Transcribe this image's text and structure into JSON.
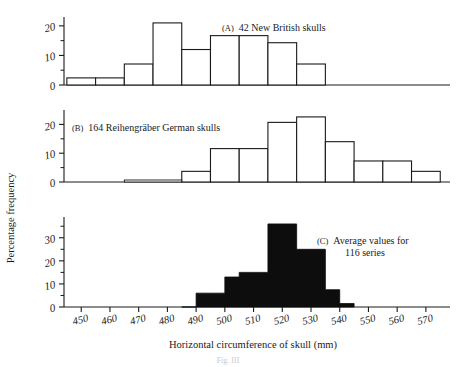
{
  "figure": {
    "axis_x_title": "Horizontal circumference of skull (mm)",
    "axis_y_title": "Percentage frequency",
    "caption": "Fig. III"
  },
  "axes": {
    "x_ticks": [
      "450",
      "460",
      "470",
      "480",
      "490",
      "500",
      "510",
      "520",
      "530",
      "540",
      "550",
      "560",
      "570"
    ],
    "x_tick_values": [
      450,
      460,
      470,
      480,
      490,
      500,
      510,
      520,
      530,
      540,
      550,
      560,
      570
    ],
    "x_min": 444,
    "x_max": 577,
    "panel_a_y_ticks": [
      "0",
      "10",
      "20"
    ],
    "panel_b_y_ticks": [
      "0",
      "10",
      "20"
    ],
    "panel_c_y_ticks": [
      "0",
      "10",
      "20",
      "30"
    ]
  },
  "panels": {
    "a": {
      "tag": "(A)",
      "note": "42 New British skulls",
      "y_max": 23,
      "y_ticks": [
        0,
        10,
        20
      ],
      "y_minor": [
        5,
        15
      ]
    },
    "b": {
      "tag": "(B)",
      "note": "164 Reihengräber German skulls",
      "y_max": 25,
      "y_ticks": [
        0,
        10,
        20
      ],
      "y_minor": [
        5,
        15
      ]
    },
    "c": {
      "tag": "(C)",
      "note_line1": "Average values for",
      "note_line2": "116 series",
      "y_max": 39,
      "y_ticks": [
        0,
        10,
        20,
        30
      ],
      "y_minor": [
        5,
        15,
        25,
        35
      ]
    }
  },
  "chart_data": [
    {
      "type": "bar",
      "id": "panel-a",
      "title": "(A) 42 New British skulls",
      "xlabel": "Horizontal circumference of skull (mm)",
      "ylabel": "Percentage frequency",
      "xlim": [
        444,
        577
      ],
      "ylim": [
        0,
        23
      ],
      "bin_width": 10,
      "grid": false,
      "filled": false,
      "bin_starts": [
        445,
        455,
        465,
        475,
        485,
        495,
        505,
        515,
        525
      ],
      "categories": [
        "445-455",
        "455-465",
        "465-475",
        "475-485",
        "485-495",
        "495-505",
        "505-515",
        "515-525",
        "525-535"
      ],
      "values": [
        2.4,
        2.4,
        7.1,
        21.0,
        12.0,
        16.7,
        16.7,
        14.3,
        7.1
      ]
    },
    {
      "type": "bar",
      "id": "panel-b",
      "title": "(B) 164 Reihengräber German skulls",
      "xlabel": "Horizontal circumference of skull (mm)",
      "ylabel": "Percentage frequency",
      "xlim": [
        444,
        577
      ],
      "ylim": [
        0,
        25
      ],
      "bin_width": 10,
      "grid": false,
      "filled": false,
      "bin_starts": [
        485,
        495,
        505,
        515,
        525,
        535,
        545,
        555,
        565
      ],
      "categories": [
        "485-495",
        "495-505",
        "505-515",
        "515-525",
        "525-535",
        "535-545",
        "545-555",
        "555-565",
        "565-575"
      ],
      "values": [
        3.7,
        11.6,
        11.6,
        20.7,
        22.6,
        14.0,
        7.3,
        7.3,
        3.7
      ]
    },
    {
      "type": "bar",
      "id": "panel-c",
      "title": "(C) Average values for 116 series",
      "xlabel": "Horizontal circumference of skull (mm)",
      "ylabel": "Percentage frequency",
      "xlim": [
        444,
        577
      ],
      "ylim": [
        0,
        39
      ],
      "bin_width": 5,
      "grid": false,
      "filled": true,
      "bin_starts": [
        485,
        490,
        495,
        500,
        505,
        510,
        515,
        520,
        525,
        530,
        535,
        540
      ],
      "categories": [
        "485-490",
        "490-495",
        "495-500",
        "500-505",
        "505-510",
        "510-515",
        "515-520",
        "520-525",
        "525-530",
        "530-535",
        "535-540",
        "540-545"
      ],
      "values": [
        0,
        6,
        6,
        13,
        15,
        15,
        36,
        36,
        25,
        25,
        7.5,
        1.5
      ]
    }
  ]
}
